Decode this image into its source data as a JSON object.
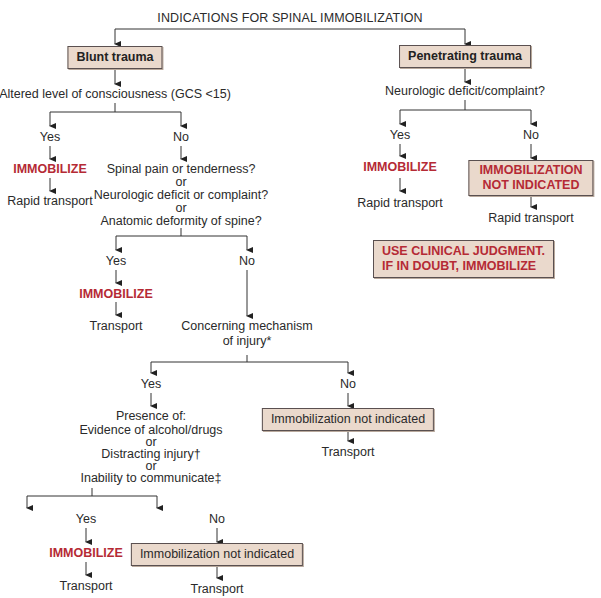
{
  "title": "INDICATIONS FOR SPINAL IMMOBILIZATION",
  "colors": {
    "box_fill": "#ead9cc",
    "box_border": "#5a5050",
    "alert_red": "#b52a35",
    "text": "#2a2a2a"
  },
  "blunt": {
    "header": "Blunt trauma",
    "q1": "Altered level of consciousness (GCS <15)",
    "q1_yes": "Yes",
    "q1_no": "No",
    "q1_yes_action": "IMMOBILIZE",
    "q1_yes_next": "Rapid transport",
    "q2": {
      "line1": "Spinal pain or tenderness?",
      "or1": "or",
      "line2": "Neurologic deficit or complaint?",
      "or2": "or",
      "line3": "Anatomic deformity of spine?"
    },
    "q2_yes": "Yes",
    "q2_no": "No",
    "q2_yes_action": "IMMOBILIZE",
    "q2_yes_next": "Transport",
    "q3": {
      "line1": "Concerning mechanism",
      "line2": "of injury*"
    },
    "q3_yes": "Yes",
    "q3_no": "No",
    "q3_no_result": "Immobilization not indicated",
    "q3_no_next": "Transport",
    "q4": {
      "line1": "Presence of:",
      "line2": "Evidence of alcohol/drugs",
      "or1": "or",
      "line3": "Distracting injury†",
      "or2": "or",
      "line4": "Inability to communicate‡"
    },
    "q4_yes": "Yes",
    "q4_no": "No",
    "q4_yes_action": "IMMOBILIZE",
    "q4_yes_next": "Transport",
    "q4_no_result": "Immobilization not indicated",
    "q4_no_next": "Transport"
  },
  "penetrating": {
    "header": "Penetrating trauma",
    "q1": "Neurologic deficit/complaint?",
    "q1_yes": "Yes",
    "q1_no": "No",
    "q1_yes_action": "IMMOBILIZE",
    "q1_yes_next": "Rapid transport",
    "q1_no_result_line1": "IMMOBILIZATION",
    "q1_no_result_line2": "NOT INDICATED",
    "q1_no_next": "Rapid transport",
    "note_line1": "USE CLINICAL JUDGMENT.",
    "note_line2": "IF IN DOUBT, IMMOBILIZE"
  }
}
